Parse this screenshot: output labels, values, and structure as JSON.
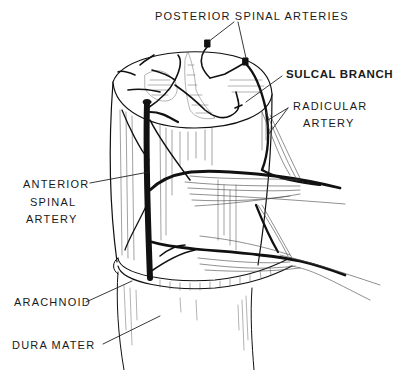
{
  "diagram": {
    "style": "black-and-white line illustration",
    "colors": {
      "ink": "#111111",
      "background": "#ffffff",
      "hatch": "#555555"
    },
    "labels": {
      "posterior_spinal_arteries": "POSTERIOR SPINAL ARTERIES",
      "sulcal_branch": "SULCAL BRANCH",
      "radicular_artery_line1": "RADICULAR",
      "radicular_artery_line2": "ARTERY",
      "anterior_spinal_artery_line1": "ANTERIOR",
      "anterior_spinal_artery_line2": "SPINAL",
      "anterior_spinal_artery_line3": "ARTERY",
      "arachnoid": "ARACHNOID",
      "dura_mater": "DURA MATER"
    }
  }
}
